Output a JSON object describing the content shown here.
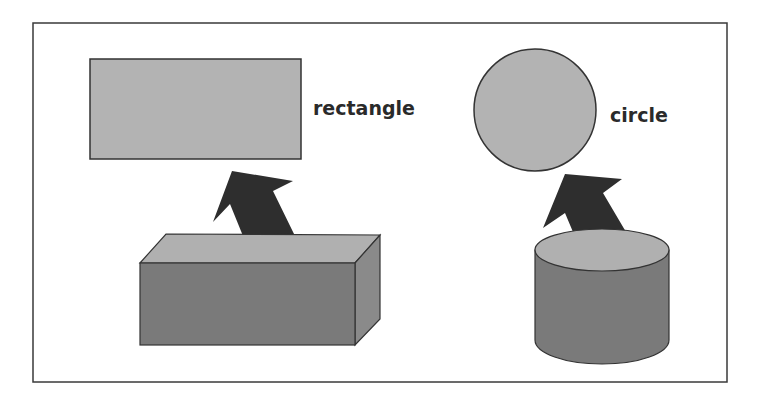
{
  "diagram": {
    "colors": {
      "frame": "#3a3a3a",
      "flat_fill": "#b3b3b3",
      "solid_front": "#7a7a7a",
      "solid_top": "#b0b0b0",
      "solid_side": "#8a8a8a",
      "arrow": "#2e2e2e",
      "outline": "#333333"
    },
    "panels": [
      {
        "solid": "rectangular prism",
        "flat_shape": "rectangle",
        "label": "rectangle"
      },
      {
        "solid": "cylinder",
        "flat_shape": "circle",
        "label": "circle"
      }
    ]
  }
}
